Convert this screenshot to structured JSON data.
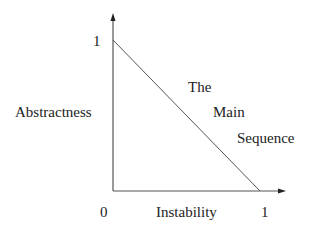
{
  "diagram": {
    "title": "The Main Sequence",
    "y_axis": {
      "label": "Abstractness",
      "tick_max": "1"
    },
    "x_axis": {
      "label": "Instability",
      "tick_min": "0",
      "tick_max": "1"
    },
    "line": {
      "from": [
        0,
        1
      ],
      "to": [
        1,
        0
      ],
      "label_words": [
        "The",
        "Main",
        "Sequence"
      ]
    },
    "colors": {
      "line": "#555555",
      "axis": "#555555",
      "text": "#222222",
      "background": "#ffffff"
    }
  }
}
